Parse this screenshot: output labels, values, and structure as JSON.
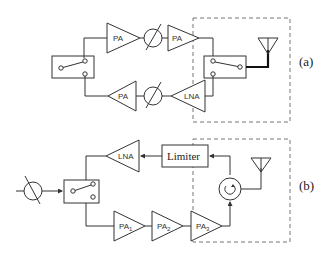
{
  "diagram": {
    "a": {
      "caption": "(a)",
      "tx_amp1": "PA",
      "tx_amp2": "PA",
      "rx_amp1": "PA",
      "rx_amp2": "LNA"
    },
    "b": {
      "caption": "(b)",
      "rx_amp": "LNA",
      "limiter": "Limiter",
      "pa1": "PA",
      "pa1_sub": "1",
      "pa2": "PA",
      "pa2_sub": "2",
      "pa3": "PA",
      "pa3_sub": "3"
    }
  },
  "colors": {
    "line": "#333333",
    "dashed_box": "#777777",
    "background": "#ffffff"
  }
}
